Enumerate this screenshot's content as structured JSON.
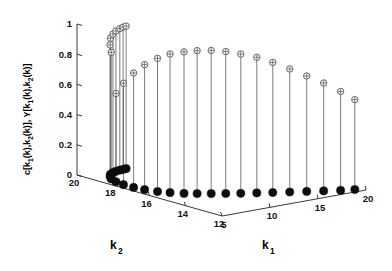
{
  "chart_data": {
    "type": "scatter",
    "title": "",
    "subtitle": "",
    "projection": "3d",
    "plot_style": "stem3",
    "grid": false,
    "legend": null,
    "zlabel": "c[k_1(k),k_2(k)], Y[k_1(k),k_2(k)]",
    "zlabel_parts": {
      "c": "c[k",
      "c_sub1": "1",
      "c_mid": "(k),k",
      "c_sub2": "2",
      "c_end": "(k)], Y[k",
      "y_sub1": "1",
      "y_mid": "(k),k",
      "y_sub2": "2",
      "y_end": "(k)]"
    },
    "xlabel": "k_1",
    "xlabel_base": "k",
    "xlabel_sub": "1",
    "ylabel": "k_2",
    "ylabel_base": "k",
    "ylabel_sub": "2",
    "zlim": [
      0,
      1
    ],
    "zticks": [
      "1",
      "0.8",
      "0.6",
      "0.4",
      "0.2",
      "0"
    ],
    "ztick_values": [
      1,
      0.8,
      0.6,
      0.4,
      0.2,
      0
    ],
    "xlim": [
      5,
      20
    ],
    "xticks": [
      "5",
      "10",
      "15",
      "20"
    ],
    "xtick_values": [
      5,
      10,
      15,
      20
    ],
    "ylim": [
      12,
      20
    ],
    "yticks": [
      "20",
      "18",
      "16",
      "14",
      "12"
    ],
    "ytick_values": [
      20,
      18,
      16,
      14,
      12
    ],
    "marker_top": "open-circle-with-cross",
    "marker_base": "filled-circle",
    "points": [
      {
        "k1": 19.4,
        "k2": 12.3,
        "v": 0.595
      },
      {
        "k1": 18.3,
        "k2": 12.5,
        "v": 0.655
      },
      {
        "k1": 17.1,
        "k2": 12.8,
        "v": 0.715
      },
      {
        "k1": 15.9,
        "k2": 13.1,
        "v": 0.765
      },
      {
        "k1": 14.7,
        "k2": 13.4,
        "v": 0.815
      },
      {
        "k1": 13.5,
        "k2": 13.7,
        "v": 0.862
      },
      {
        "k1": 12.4,
        "k2": 14.0,
        "v": 0.898
      },
      {
        "k1": 11.3,
        "k2": 14.3,
        "v": 0.922
      },
      {
        "k1": 10.3,
        "k2": 14.6,
        "v": 0.94
      },
      {
        "k1": 9.35,
        "k2": 14.9,
        "v": 0.948
      },
      {
        "k1": 8.45,
        "k2": 15.2,
        "v": 0.947
      },
      {
        "k1": 7.65,
        "k2": 15.5,
        "v": 0.938
      },
      {
        "k1": 6.95,
        "k2": 15.9,
        "v": 0.918
      },
      {
        "k1": 6.4,
        "k2": 16.3,
        "v": 0.882
      },
      {
        "k1": 6.0,
        "k2": 16.8,
        "v": 0.828
      },
      {
        "k1": 5.8,
        "k2": 17.3,
        "v": 0.758
      },
      {
        "k1": 5.78,
        "k2": 17.85,
        "v": 0.672
      },
      {
        "k1": 5.95,
        "k2": 18.35,
        "v": 0.585
      },
      {
        "k1": 6.3,
        "k2": 18.8,
        "v": 0.838
      },
      {
        "k1": 6.75,
        "k2": 19.1,
        "v": 0.872
      },
      {
        "k1": 7.25,
        "k2": 19.35,
        "v": 0.902
      },
      {
        "k1": 7.8,
        "k2": 19.5,
        "v": 0.918
      },
      {
        "k1": 8.3,
        "k2": 19.6,
        "v": 0.93
      },
      {
        "k1": 8.8,
        "k2": 19.65,
        "v": 0.938
      },
      {
        "k1": 9.2,
        "k2": 19.68,
        "v": 0.942
      },
      {
        "k1": 9.55,
        "k2": 19.7,
        "v": 0.944
      }
    ]
  }
}
